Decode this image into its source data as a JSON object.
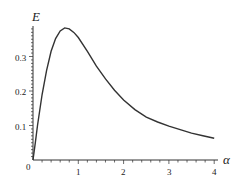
{
  "chart_data": {
    "type": "line",
    "title": "",
    "xlabel": "α",
    "ylabel": "E",
    "xlim": [
      0,
      4
    ],
    "ylim": [
      0,
      0.39
    ],
    "xticks": [
      0,
      1,
      2,
      3,
      4
    ],
    "yticks": [
      0.1,
      0.2,
      0.3
    ],
    "grid": false,
    "legend": null,
    "series": [
      {
        "name": "E(α)",
        "x": [
          0,
          0.05,
          0.1,
          0.15,
          0.2,
          0.3,
          0.4,
          0.5,
          0.6,
          0.7,
          0.8,
          0.9,
          1.0,
          1.2,
          1.4,
          1.6,
          1.8,
          2.0,
          2.25,
          2.5,
          2.75,
          3.0,
          3.25,
          3.5,
          3.75,
          4.0
        ],
        "values": [
          0,
          0.05,
          0.1,
          0.145,
          0.19,
          0.26,
          0.315,
          0.352,
          0.374,
          0.383,
          0.38,
          0.37,
          0.355,
          0.315,
          0.272,
          0.235,
          0.202,
          0.174,
          0.146,
          0.124,
          0.11,
          0.098,
          0.088,
          0.078,
          0.07,
          0.063
        ]
      }
    ]
  },
  "labels": {
    "x_axis": "α",
    "y_axis": "E",
    "origin": "0",
    "xtick_1": "1",
    "xtick_2": "2",
    "xtick_3": "3",
    "xtick_4": "4",
    "ytick_1": "0.1",
    "ytick_2": "0.2",
    "ytick_3": "0.3"
  }
}
